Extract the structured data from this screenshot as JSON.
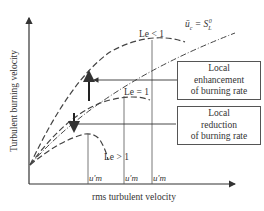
{
  "diagram": {
    "y_axis_label": "Turbulent burning velocity",
    "x_axis_label": "rms turbulent velocity",
    "reference_line_label": "ū_c = S_L^0",
    "curves": [
      {
        "label": "Le < 1",
        "style": "dashed"
      },
      {
        "label": "Le = 1",
        "style": "dashed"
      },
      {
        "label": "Le > 1",
        "style": "dashed"
      }
    ],
    "boxes": {
      "enhancement": [
        "Local",
        "enhancement",
        "of burning rate"
      ],
      "reduction": [
        "Local",
        "reduction",
        "of burning rate"
      ]
    },
    "tick_labels": [
      "u'm",
      "u'm",
      "u'm"
    ]
  }
}
